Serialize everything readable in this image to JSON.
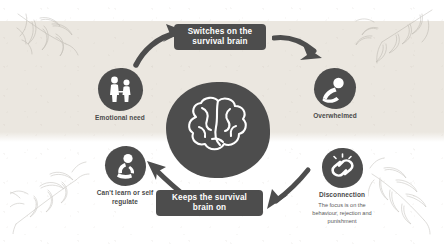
{
  "diagram": {
    "colors": {
      "node_fill": "#4d4d4d",
      "pill_fill": "#4d4d4d",
      "pill_text": "#ffffff",
      "band": "#ebe7e0",
      "page": "#ffffff",
      "label_text": "#4a4a4a",
      "botanical": "#9a958c"
    },
    "pills": [
      {
        "id": "switches-on",
        "text": "Switches on the\nsurvival brain"
      },
      {
        "id": "keeps-on",
        "text": "Keeps the survival\nbrain on"
      }
    ],
    "center": {
      "label": "",
      "icon": "brain-icon"
    },
    "nodes": [
      {
        "id": "emotional-need",
        "label": "Emotional need",
        "sub": "",
        "icon": "two-people-icon"
      },
      {
        "id": "overwhelmed",
        "label": "Overwhelmed",
        "sub": "",
        "icon": "distressed-person-icon"
      },
      {
        "id": "disconnection",
        "label": "Disconnection",
        "sub": "The focus is on the\nbehaviour, rejection and\npunishment",
        "icon": "broken-chain-icon"
      },
      {
        "id": "cant-learn",
        "label": "Can't learn or self\nregulate",
        "sub": "",
        "icon": "curled-person-icon"
      }
    ],
    "arrows": [
      {
        "id": "arrow-need-to-switches",
        "direction": "up-right"
      },
      {
        "id": "arrow-switches-to-overwhelmed",
        "direction": "down-right"
      },
      {
        "id": "arrow-overwhelmed-to-disconnection",
        "direction": "down-left"
      },
      {
        "id": "arrow-disconnection-to-keeps",
        "direction": "down-left"
      },
      {
        "id": "arrow-keeps-to-cant-learn",
        "direction": "up-left"
      }
    ],
    "botanicals": [
      {
        "id": "botanical-top-left"
      },
      {
        "id": "botanical-top-right"
      },
      {
        "id": "botanical-bottom-left"
      },
      {
        "id": "botanical-bottom-right"
      }
    ]
  }
}
